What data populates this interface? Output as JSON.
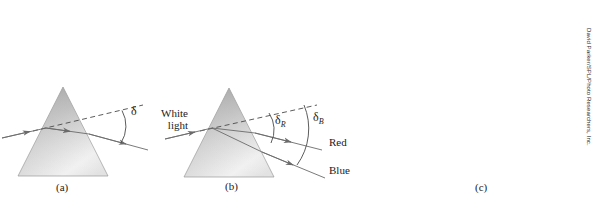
{
  "figure": {
    "panels": [
      {
        "id": "a",
        "caption": "(a)",
        "labels": {
          "deviation_angle": "δ"
        }
      },
      {
        "id": "b",
        "caption": "(b)",
        "labels": {
          "incident_beam_line1": "White",
          "incident_beam_line2": "light",
          "deviation_red": "δ",
          "deviation_red_sub": "R",
          "deviation_blue": "δ",
          "deviation_blue_sub": "B",
          "ray_red": "Red",
          "ray_blue": "Blue"
        }
      },
      {
        "id": "c",
        "caption": "(c)",
        "credit": "David Parker/SPL/Photo Researchers, Inc."
      }
    ]
  },
  "colors": {
    "prism_fill_light": "#f2f2f2",
    "prism_fill_mid": "#cfcfcf",
    "prism_fill_dark": "#a9a9a9",
    "ray_stroke": "#6b6b6b",
    "text": "#1a1a1a",
    "photo_background": "#000000"
  }
}
